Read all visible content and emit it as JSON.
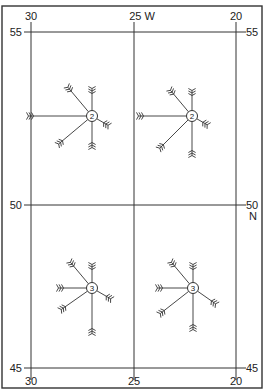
{
  "map": {
    "type": "wind-rose-chart",
    "frame": {
      "x": 2,
      "y": 6,
      "width": 260,
      "height": 382
    },
    "colors": {
      "line": "#333333",
      "text": "#222222",
      "background": "#ffffff"
    },
    "longitudes": [
      {
        "value": "30",
        "x": 31,
        "top_label": "30",
        "bottom_label": "30"
      },
      {
        "value": "25",
        "x": 134,
        "top_label": "25 W",
        "bottom_label": "25"
      },
      {
        "value": "20",
        "x": 236,
        "top_label": "20",
        "bottom_label": "20"
      }
    ],
    "latitudes": [
      {
        "value": "55",
        "y": 32,
        "left_label": "55",
        "right_label": "55"
      },
      {
        "value": "50",
        "y": 205,
        "left_label": "50",
        "right_label": "50",
        "right_sub": "N"
      },
      {
        "value": "45",
        "y": 368,
        "left_label": "45",
        "right_label": "45"
      }
    ],
    "roses": [
      {
        "id": "rose-top-left",
        "cx": 92,
        "cy": 116,
        "center_label": "2",
        "arms": [
          {
            "dir": "W",
            "angle": 180,
            "length": 58
          },
          {
            "dir": "NW",
            "angle": 130,
            "length": 32
          },
          {
            "dir": "N",
            "angle": 90,
            "length": 22
          },
          {
            "dir": "ESE",
            "angle": -30,
            "length": 13
          },
          {
            "dir": "SW",
            "angle": 220,
            "length": 38
          },
          {
            "dir": "S",
            "angle": 270,
            "length": 26
          }
        ]
      },
      {
        "id": "rose-top-right",
        "cx": 192,
        "cy": 116,
        "center_label": "2",
        "arms": [
          {
            "dir": "W",
            "angle": 180,
            "length": 48
          },
          {
            "dir": "NW",
            "angle": 130,
            "length": 28
          },
          {
            "dir": "N",
            "angle": 90,
            "length": 20
          },
          {
            "dir": "ESE",
            "angle": -30,
            "length": 12
          },
          {
            "dir": "SW",
            "angle": 225,
            "length": 40
          },
          {
            "dir": "S",
            "angle": 270,
            "length": 34
          }
        ]
      },
      {
        "id": "rose-bottom-left",
        "cx": 92,
        "cy": 288,
        "center_label": "3",
        "arms": [
          {
            "dir": "W",
            "angle": 180,
            "length": 28
          },
          {
            "dir": "NW",
            "angle": 130,
            "length": 28
          },
          {
            "dir": "N",
            "angle": 90,
            "length": 18
          },
          {
            "dir": "ESE",
            "angle": -30,
            "length": 16
          },
          {
            "dir": "SW",
            "angle": 215,
            "length": 32
          },
          {
            "dir": "S",
            "angle": 270,
            "length": 40
          }
        ]
      },
      {
        "id": "rose-bottom-right",
        "cx": 193,
        "cy": 288,
        "center_label": "3",
        "arms": [
          {
            "dir": "W",
            "angle": 180,
            "length": 30
          },
          {
            "dir": "NW",
            "angle": 130,
            "length": 28
          },
          {
            "dir": "N",
            "angle": 90,
            "length": 18
          },
          {
            "dir": "ESE",
            "angle": -35,
            "length": 22
          },
          {
            "dir": "SW",
            "angle": 218,
            "length": 36
          },
          {
            "dir": "S",
            "angle": 270,
            "length": 36
          }
        ]
      }
    ]
  }
}
